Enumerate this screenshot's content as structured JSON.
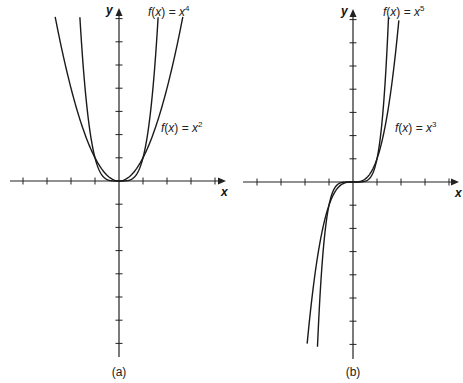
{
  "chart_data": [
    {
      "type": "line",
      "panel": "(a)",
      "title": "",
      "xlabel": "x",
      "ylabel": "y",
      "xlim": [
        -4.5,
        4.5
      ],
      "ylim": [
        -7.5,
        7.5
      ],
      "grid": false,
      "x_ticks": [
        -4,
        -3,
        -2,
        -1,
        1,
        2,
        3,
        4
      ],
      "y_ticks": [
        -7,
        -6,
        -5,
        -4,
        -3,
        -2,
        -1,
        1,
        2,
        3,
        4,
        5,
        6,
        7
      ],
      "tick_labels_shown": false,
      "series": [
        {
          "name": "f(x) = x^4",
          "expr": "x^4",
          "x_range": [
            -1.63,
            1.63
          ],
          "x": [
            -1.6,
            -1.2,
            -0.8,
            -0.4,
            0,
            0.4,
            0.8,
            1.2,
            1.6
          ],
          "values": [
            6.55,
            2.07,
            0.41,
            0.03,
            0,
            0.03,
            0.41,
            2.07,
            6.55
          ]
        },
        {
          "name": "f(x) = x^2",
          "expr": "x^2",
          "x_range": [
            -2.66,
            2.66
          ],
          "x": [
            -2.6,
            -2,
            -1.5,
            -1,
            -0.5,
            0,
            0.5,
            1,
            1.5,
            2,
            2.6
          ],
          "values": [
            6.76,
            4,
            2.25,
            1,
            0.25,
            0,
            0.25,
            1,
            2.25,
            4,
            6.76
          ]
        }
      ],
      "annotations": [
        {
          "text": "f(x) = x^4",
          "position": "top, right of y-axis"
        },
        {
          "text": "f(x) = x^2",
          "position": "right of x^2 curve, mid-height"
        }
      ]
    },
    {
      "type": "line",
      "panel": "(b)",
      "title": "",
      "xlabel": "x",
      "ylabel": "y",
      "xlim": [
        -4.5,
        4.5
      ],
      "ylim": [
        -7.5,
        7.5
      ],
      "grid": false,
      "x_ticks": [
        -4,
        -3,
        -2,
        -1,
        1,
        2,
        3,
        4
      ],
      "y_ticks": [
        -7,
        -6,
        -5,
        -4,
        -3,
        -2,
        -1,
        1,
        2,
        3,
        4,
        5,
        6,
        7
      ],
      "tick_labels_shown": false,
      "series": [
        {
          "name": "f(x) = x^5",
          "expr": "x^5",
          "x_range": [
            -1.48,
            1.48
          ],
          "x": [
            -1.4,
            -1,
            -0.6,
            0,
            0.6,
            1,
            1.4
          ],
          "values": [
            -5.38,
            -1,
            -0.08,
            0,
            0.08,
            1,
            5.38
          ]
        },
        {
          "name": "f(x) = x^3",
          "expr": "x^3",
          "x_range": [
            -1.91,
            1.91
          ],
          "x": [
            -1.8,
            -1.4,
            -1,
            -0.6,
            0,
            0.6,
            1,
            1.4,
            1.8
          ],
          "values": [
            -5.83,
            -2.74,
            -1,
            -0.22,
            0,
            0.22,
            1,
            2.74,
            5.83
          ]
        }
      ],
      "annotations": [
        {
          "text": "f(x) = x^5",
          "position": "top, right of y-axis"
        },
        {
          "text": "f(x) = x^3",
          "position": "right of x^3 curve, mid-height"
        }
      ]
    }
  ],
  "panels": {
    "a": {
      "tag": "(a)",
      "x_axis_label": "x",
      "y_axis_label": "y",
      "label_top": {
        "fn": "f",
        "var": "x",
        "rhs": "x",
        "exp": "4"
      },
      "label_mid": {
        "fn": "f",
        "var": "x",
        "rhs": "x",
        "exp": "2"
      }
    },
    "b": {
      "tag": "(b)",
      "x_axis_label": "x",
      "y_axis_label": "y",
      "label_top": {
        "fn": "f",
        "var": "x",
        "rhs": "x",
        "exp": "5"
      },
      "label_mid": {
        "fn": "f",
        "var": "x",
        "rhs": "x",
        "exp": "3"
      }
    }
  },
  "style": {
    "line_color": "#1a1a1a",
    "axis_color": "#222222",
    "background": "#ffffff"
  }
}
